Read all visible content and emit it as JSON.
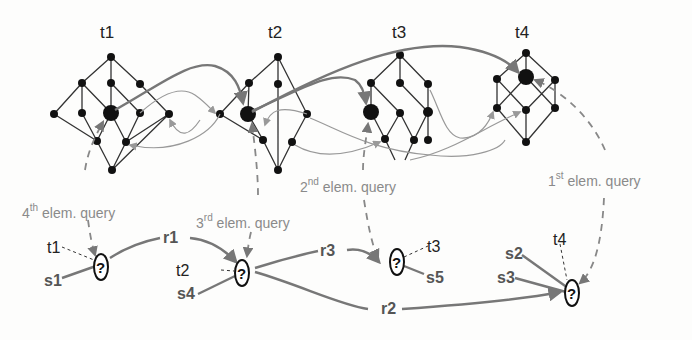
{
  "lattices": [
    {
      "id": "t1",
      "label": "t1"
    },
    {
      "id": "t2",
      "label": "t2"
    },
    {
      "id": "t3",
      "label": "t3"
    },
    {
      "id": "t4",
      "label": "t4"
    }
  ],
  "queries": {
    "q1": {
      "num": "1",
      "sup": "st",
      "text": " elem. query"
    },
    "q2": {
      "num": "2",
      "sup": "nd",
      "text": " elem. query"
    },
    "q3": {
      "num": "3",
      "sup": "rd",
      "text": " elem. query"
    },
    "q4": {
      "num": "4",
      "sup": "th",
      "text": " elem. query"
    }
  },
  "query_graph": {
    "unknown_symbol": "?",
    "nodes": [
      {
        "id": "n1",
        "type_label": "t1",
        "subject": "s1"
      },
      {
        "id": "n2",
        "type_label": "t2",
        "subject": "s4"
      },
      {
        "id": "n3",
        "type_label": "t3",
        "subject": "s5"
      },
      {
        "id": "n4",
        "type_label": "t4",
        "subjects": [
          "s2",
          "s3"
        ]
      }
    ],
    "relations": [
      {
        "label": "r1",
        "from": "n1",
        "to": "n2"
      },
      {
        "label": "r2",
        "from": "n2",
        "to": "n4"
      },
      {
        "label": "r3",
        "from": "n2",
        "to": "n3"
      }
    ]
  }
}
